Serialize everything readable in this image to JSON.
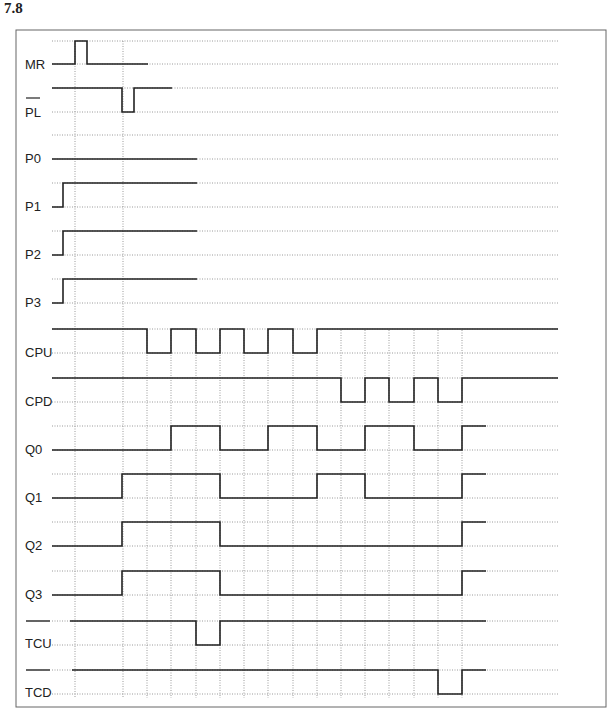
{
  "heading": "7.8",
  "frame": {
    "x": 16,
    "y": 30,
    "w": 590,
    "h": 677,
    "stroke": "#666666"
  },
  "grid": {
    "x_start": 52,
    "x_end": 558,
    "dotted_color": "#9a9a9a",
    "verticals_top": [
      75,
      123
    ],
    "verticals_clock": [
      74,
      123,
      147,
      171,
      196,
      220,
      244,
      268,
      293,
      317,
      341,
      365,
      389,
      414,
      438,
      462
    ],
    "clock_vertical_top": 330
  },
  "signal_color": "#222222",
  "signals": [
    {
      "name": "MR",
      "overbar": false,
      "label_y": 69,
      "high_y": 41,
      "low_y": 64,
      "points": [
        [
          52,
          "L"
        ],
        [
          75,
          "H"
        ],
        [
          87,
          "L"
        ],
        [
          148,
          "L"
        ]
      ]
    },
    {
      "name": "PL",
      "overbar": true,
      "label_y": 117,
      "high_y": 88,
      "low_y": 112,
      "points": [
        [
          52,
          "H"
        ],
        [
          122,
          "L"
        ],
        [
          134,
          "H"
        ],
        [
          172,
          "H"
        ]
      ]
    },
    {
      "name": "P0",
      "overbar": false,
      "label_y": 163,
      "high_y": 135,
      "low_y": 159,
      "points": [
        [
          52,
          "L"
        ],
        [
          197,
          "L"
        ]
      ]
    },
    {
      "name": "P1",
      "overbar": false,
      "label_y": 211,
      "high_y": 183,
      "low_y": 207,
      "points": [
        [
          52,
          "L"
        ],
        [
          63,
          "H"
        ],
        [
          197,
          "H"
        ]
      ]
    },
    {
      "name": "P2",
      "overbar": false,
      "label_y": 259,
      "high_y": 231,
      "low_y": 255,
      "points": [
        [
          52,
          "L"
        ],
        [
          63,
          "H"
        ],
        [
          197,
          "H"
        ]
      ]
    },
    {
      "name": "P3",
      "overbar": false,
      "label_y": 307,
      "high_y": 279,
      "low_y": 303,
      "points": [
        [
          52,
          "L"
        ],
        [
          63,
          "H"
        ],
        [
          197,
          "H"
        ]
      ]
    },
    {
      "name": "CPU",
      "overbar": false,
      "label_y": 357,
      "high_y": 329,
      "low_y": 353,
      "points": [
        [
          52,
          "H"
        ],
        [
          147,
          "L"
        ],
        [
          171,
          "H"
        ],
        [
          196,
          "L"
        ],
        [
          220,
          "H"
        ],
        [
          244,
          "L"
        ],
        [
          268,
          "H"
        ],
        [
          293,
          "L"
        ],
        [
          317,
          "H"
        ],
        [
          558,
          "H"
        ]
      ]
    },
    {
      "name": "CPD",
      "overbar": false,
      "label_y": 406,
      "high_y": 378,
      "low_y": 402,
      "points": [
        [
          52,
          "H"
        ],
        [
          341,
          "L"
        ],
        [
          365,
          "H"
        ],
        [
          389,
          "L"
        ],
        [
          414,
          "H"
        ],
        [
          438,
          "L"
        ],
        [
          462,
          "H"
        ],
        [
          558,
          "H"
        ]
      ]
    },
    {
      "name": "Q0",
      "overbar": false,
      "label_y": 454,
      "high_y": 426,
      "low_y": 450,
      "points": [
        [
          52,
          "L"
        ],
        [
          171,
          "H"
        ],
        [
          220,
          "L"
        ],
        [
          268,
          "H"
        ],
        [
          317,
          "L"
        ],
        [
          365,
          "H"
        ],
        [
          414,
          "L"
        ],
        [
          462,
          "H"
        ],
        [
          486,
          "H"
        ]
      ]
    },
    {
      "name": "Q1",
      "overbar": false,
      "label_y": 502,
      "high_y": 474,
      "low_y": 498,
      "points": [
        [
          52,
          "L"
        ],
        [
          122,
          "H"
        ],
        [
          220,
          "L"
        ],
        [
          317,
          "H"
        ],
        [
          365,
          "L"
        ],
        [
          462,
          "H"
        ],
        [
          486,
          "H"
        ]
      ]
    },
    {
      "name": "Q2",
      "overbar": false,
      "label_y": 550,
      "high_y": 522,
      "low_y": 546,
      "points": [
        [
          52,
          "L"
        ],
        [
          122,
          "H"
        ],
        [
          220,
          "L"
        ],
        [
          462,
          "H"
        ],
        [
          486,
          "H"
        ]
      ]
    },
    {
      "name": "Q3",
      "overbar": false,
      "label_y": 599,
      "high_y": 571,
      "low_y": 595,
      "points": [
        [
          52,
          "L"
        ],
        [
          122,
          "H"
        ],
        [
          220,
          "L"
        ],
        [
          462,
          "H"
        ],
        [
          486,
          "H"
        ]
      ]
    },
    {
      "name": "TCU",
      "overbar": true,
      "label_y": 648,
      "high_y": 621,
      "low_y": 645,
      "points": [
        [
          70,
          "H"
        ],
        [
          196,
          "L"
        ],
        [
          220,
          "H"
        ],
        [
          486,
          "H"
        ]
      ]
    },
    {
      "name": "TCD",
      "overbar": true,
      "label_y": 697,
      "high_y": 670,
      "low_y": 694,
      "points": [
        [
          72,
          "H"
        ],
        [
          438,
          "L"
        ],
        [
          462,
          "H"
        ],
        [
          486,
          "H"
        ]
      ]
    }
  ]
}
